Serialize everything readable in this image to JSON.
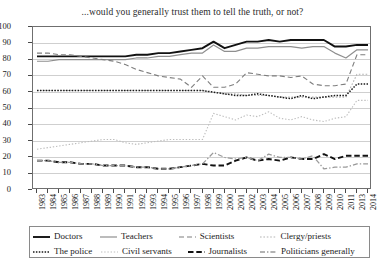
{
  "chart_data": {
    "type": "line",
    "title": "...would you generally trust them to tell the truth, or not?",
    "xlabel": "",
    "ylabel": "",
    "ylim": [
      0,
      100
    ],
    "ytick_step": 10,
    "grid": true,
    "legend_position": "bottom",
    "yticks": [
      "0",
      "10",
      "20",
      "30",
      "40",
      "50",
      "60",
      "70",
      "80",
      "90",
      "100"
    ],
    "categories": [
      "1983",
      "1984",
      "1985",
      "1986",
      "1987",
      "1988",
      "1989",
      "1990",
      "1991",
      "1992",
      "1993",
      "1994",
      "1995",
      "1996",
      "1997",
      "1998",
      "1999",
      "2000",
      "2001",
      "2002",
      "2003",
      "2004",
      "2005",
      "2006",
      "2007",
      "2008",
      "2009",
      "2010",
      "2011",
      "2013",
      "2014"
    ],
    "series": [
      {
        "name": "Doctors",
        "style": "solid-thick-black",
        "color": "#111111",
        "values": [
          82,
          82,
          82,
          82,
          82,
          82,
          82,
          82,
          82,
          83,
          83,
          84,
          84,
          85,
          86,
          87,
          91,
          87,
          89,
          91,
          91,
          92,
          91,
          92,
          92,
          92,
          92,
          88,
          88,
          89,
          89
        ]
      },
      {
        "name": "Teachers",
        "style": "solid-gray",
        "color": "#8f8f8f",
        "values": [
          79,
          79,
          80,
          80,
          80,
          80,
          80,
          80,
          80,
          81,
          81,
          82,
          82,
          83,
          84,
          84,
          89,
          85,
          85,
          87,
          87,
          88,
          88,
          88,
          87,
          88,
          88,
          84,
          81,
          86,
          86
        ]
      },
      {
        "name": "Scientists",
        "style": "dashed-gray",
        "color": "#7e7e7e",
        "values": [
          84,
          84,
          83,
          83,
          82,
          81,
          80,
          79,
          77,
          74,
          72,
          70,
          69,
          68,
          63,
          70,
          63,
          63,
          65,
          72,
          71,
          70,
          70,
          69,
          70,
          65,
          64,
          64,
          65,
          83,
          83
        ]
      },
      {
        "name": "Clergy/priests",
        "style": "dotted-light-gray",
        "color": "#b3b3b3",
        "values": [
          61,
          61,
          61,
          61,
          61,
          61,
          61,
          61,
          61,
          61,
          61,
          61,
          61,
          61,
          61,
          61,
          60,
          59,
          59,
          58,
          58,
          58,
          57,
          57,
          57,
          57,
          57,
          57,
          57,
          71,
          71
        ]
      },
      {
        "name": "The police",
        "style": "fine-dotted-black",
        "color": "#1a1a1a",
        "values": [
          61,
          61,
          61,
          61,
          61,
          61,
          61,
          61,
          61,
          61,
          61,
          61,
          61,
          61,
          61,
          61,
          60,
          59,
          58,
          58,
          59,
          58,
          57,
          56,
          58,
          56,
          57,
          58,
          58,
          65,
          65
        ]
      },
      {
        "name": "Civil servants",
        "style": "dotted-pale-gray",
        "color": "#bdbdbd",
        "values": [
          25,
          26,
          27,
          28,
          29,
          30,
          31,
          31,
          29,
          28,
          29,
          30,
          31,
          31,
          31,
          31,
          47,
          45,
          43,
          46,
          45,
          48,
          44,
          43,
          45,
          43,
          42,
          44,
          45,
          55,
          55
        ]
      },
      {
        "name": "Journalists",
        "style": "dashed-thick-black",
        "color": "#111111",
        "values": [
          18,
          18,
          17,
          17,
          16,
          16,
          15,
          15,
          15,
          14,
          14,
          13,
          13,
          14,
          15,
          16,
          15,
          15,
          18,
          20,
          18,
          19,
          18,
          20,
          19,
          19,
          22,
          19,
          21,
          21,
          21
        ]
      },
      {
        "name": "Politicians generally",
        "style": "dash-dot-gray",
        "color": "#9a9a9a",
        "values": [
          18,
          18,
          17,
          17,
          16,
          16,
          15,
          15,
          15,
          14,
          14,
          13,
          13,
          14,
          15,
          16,
          23,
          20,
          19,
          20,
          18,
          22,
          20,
          20,
          19,
          21,
          13,
          14,
          14,
          16,
          16
        ]
      }
    ]
  },
  "legend": {
    "items": [
      {
        "label": "Doctors",
        "swatch": "solid-thick-black"
      },
      {
        "label": "Teachers",
        "swatch": "solid-gray"
      },
      {
        "label": "Scientists",
        "swatch": "dashed-gray"
      },
      {
        "label": "Clergy/priests",
        "swatch": "dotted-light-gray"
      },
      {
        "label": "The police",
        "swatch": "fine-dotted-black"
      },
      {
        "label": "Civil servants",
        "swatch": "dotted-pale-gray"
      },
      {
        "label": "Journalists",
        "swatch": "dashed-thick-black"
      },
      {
        "label": "Politicians generally",
        "swatch": "dash-dot-gray"
      }
    ]
  }
}
